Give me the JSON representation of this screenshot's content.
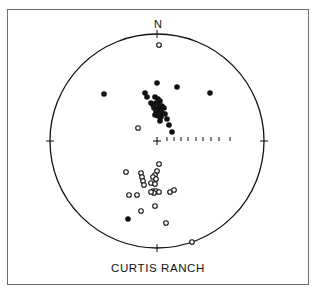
{
  "diagram": {
    "type": "stereonet",
    "title": "CURTIS RANCH",
    "north_label": "N",
    "colors": {
      "ink": "#111111",
      "frame": "#6e6e6e",
      "background": "#ffffff"
    },
    "net": {
      "cx": 157,
      "cy": 141,
      "r": 107
    },
    "east_ticks_x": [
      167,
      174,
      181,
      188,
      196,
      203,
      211,
      219,
      230
    ],
    "legend": {
      "filled": "normal polarity (lower hemisphere)",
      "open": "reversed polarity (upper hemisphere)"
    }
  },
  "chart_data": {
    "type": "scatter",
    "title": "CURTIS RANCH",
    "xlabel": "",
    "ylabel": "",
    "note": "Equal-area stereonet; coordinates are pixel positions relative to net center (x right=East, y down=South), radius 107",
    "series": [
      {
        "name": "filled",
        "points": [
          [
            0,
            -58
          ],
          [
            20,
            -54
          ],
          [
            53,
            -48
          ],
          [
            -53,
            -47
          ],
          [
            -12,
            -48
          ],
          [
            -10,
            -44
          ],
          [
            -6,
            -38
          ],
          [
            -4,
            -36
          ],
          [
            -2,
            -44
          ],
          [
            1,
            -42
          ],
          [
            3,
            -40
          ],
          [
            -1,
            -38
          ],
          [
            2,
            -36
          ],
          [
            5,
            -35
          ],
          [
            -3,
            -33
          ],
          [
            0,
            -32
          ],
          [
            4,
            -32
          ],
          [
            7,
            -33
          ],
          [
            -1,
            -29
          ],
          [
            2,
            -30
          ],
          [
            5,
            -28
          ],
          [
            -2,
            -26
          ],
          [
            1,
            -25
          ],
          [
            4,
            -24
          ],
          [
            8,
            -27
          ],
          [
            10,
            -22
          ],
          [
            3,
            -20
          ],
          [
            12,
            -16
          ],
          [
            15,
            -9
          ],
          [
            -29,
            78
          ]
        ]
      },
      {
        "name": "open",
        "points": [
          [
            2,
            -96
          ],
          [
            -19,
            -13
          ],
          [
            2,
            23
          ],
          [
            0,
            30
          ],
          [
            -2,
            34
          ],
          [
            -4,
            36
          ],
          [
            -1,
            38
          ],
          [
            -16,
            32
          ],
          [
            -15,
            36
          ],
          [
            -14,
            40
          ],
          [
            -13,
            44
          ],
          [
            -31,
            31
          ],
          [
            -6,
            42
          ],
          [
            -2,
            43
          ],
          [
            -4,
            50
          ],
          [
            -1,
            50
          ],
          [
            2,
            51
          ],
          [
            -3,
            52
          ],
          [
            -6,
            51
          ],
          [
            13,
            51
          ],
          [
            17,
            49
          ],
          [
            -28,
            54
          ],
          [
            -20,
            54
          ],
          [
            -2,
            65
          ],
          [
            -16,
            70
          ],
          [
            9,
            82
          ],
          [
            35,
            101
          ]
        ]
      }
    ]
  }
}
